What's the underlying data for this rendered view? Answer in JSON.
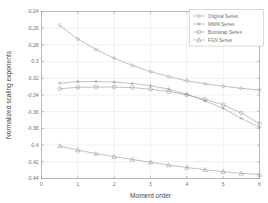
{
  "chart_data": {
    "type": "line",
    "title": "",
    "xlabel": "Moment order",
    "ylabel": "Normalized scaling exponents",
    "xlim": [
      0,
      6
    ],
    "ylim": [
      -0.44,
      -0.24
    ],
    "xticks": [
      0,
      1,
      2,
      3,
      4,
      5,
      6
    ],
    "xticklabels": [
      "0",
      "1",
      "2",
      "3",
      "4",
      "5",
      "6"
    ],
    "yticks": [
      -0.44,
      -0.42,
      -0.4,
      -0.38,
      -0.36,
      -0.34,
      -0.32,
      -0.3,
      -0.28,
      -0.26,
      -0.24
    ],
    "yticklabels": [
      "-0.44",
      "-0.42",
      "-0.4",
      "-0.38",
      "-0.36",
      "-0.34",
      "-0.32",
      "-0.3",
      "-0.28",
      "-0.26",
      "-0.24"
    ],
    "grid": true,
    "legend_position": "upper right",
    "x": [
      0.5,
      1.0,
      1.5,
      2.0,
      2.5,
      3.0,
      3.5,
      4.0,
      4.5,
      5.0,
      5.5,
      6.0
    ],
    "series": [
      {
        "name": "Original Series",
        "marker": "diamond",
        "values": [
          -0.2565,
          -0.273,
          -0.2855,
          -0.296,
          -0.3045,
          -0.312,
          -0.318,
          -0.323,
          -0.3265,
          -0.3295,
          -0.332,
          -0.334
        ]
      },
      {
        "name": "MWM Series",
        "marker": "plus",
        "values": [
          -0.3258,
          -0.324,
          -0.3238,
          -0.3245,
          -0.3262,
          -0.3288,
          -0.333,
          -0.3392,
          -0.347,
          -0.356,
          -0.368,
          -0.379
        ]
      },
      {
        "name": "Bootstrap Series",
        "marker": "circle",
        "values": [
          -0.3325,
          -0.3308,
          -0.3305,
          -0.3305,
          -0.3312,
          -0.333,
          -0.3358,
          -0.3398,
          -0.3452,
          -0.3518,
          -0.3615,
          -0.3745
        ]
      },
      {
        "name": "FGN Series",
        "marker": "triangle",
        "values": [
          -0.401,
          -0.406,
          -0.4102,
          -0.4138,
          -0.4172,
          -0.4205,
          -0.4238,
          -0.4268,
          -0.4295,
          -0.4318,
          -0.4338,
          -0.4352
        ]
      }
    ]
  },
  "legend": {
    "entries": [
      "Original Series",
      "MWM Series",
      "Bootstrap Series",
      "FGN Series"
    ]
  },
  "colors": {
    "line": "#8e8e8e",
    "grid": "#d8d8d8",
    "axis": "#9a9a9a",
    "text": "#6e6e6e",
    "background": "#ffffff"
  }
}
